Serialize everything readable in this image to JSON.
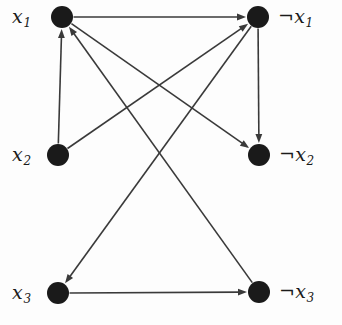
{
  "figure": {
    "kind": "implication-graph",
    "title": "",
    "background_color": "#fdfdfd",
    "node_color": "#1a1a1a",
    "edge_color": "#3a3a3a",
    "label_color": "#1a1a1a"
  },
  "nodes": [
    {
      "id": "x1",
      "label_prefix": "",
      "label_var": "x",
      "label_sub": "1",
      "label_text": "x1",
      "x": 62,
      "y": 17,
      "r": 11,
      "label_x": 12,
      "label_y": 7,
      "label_align": "left"
    },
    {
      "id": "nx1",
      "label_prefix": "¬",
      "label_var": "x",
      "label_sub": "1",
      "label_text": "¬x1",
      "x": 258,
      "y": 17,
      "r": 11,
      "label_x": 278,
      "label_y": 7,
      "label_align": "left"
    },
    {
      "id": "x2",
      "label_prefix": "",
      "label_var": "x",
      "label_sub": "2",
      "label_text": "x2",
      "x": 58,
      "y": 155,
      "r": 11,
      "label_x": 12,
      "label_y": 145,
      "label_align": "left"
    },
    {
      "id": "nx2",
      "label_prefix": "¬",
      "label_var": "x",
      "label_sub": "2",
      "label_text": "¬x2",
      "x": 259,
      "y": 155,
      "r": 11,
      "label_x": 279,
      "label_y": 145,
      "label_align": "left"
    },
    {
      "id": "x3",
      "label_prefix": "",
      "label_var": "x",
      "label_sub": "3",
      "label_text": "x3",
      "x": 58,
      "y": 293,
      "r": 11,
      "label_x": 12,
      "label_y": 283,
      "label_align": "left"
    },
    {
      "id": "nx3",
      "label_prefix": "¬",
      "label_var": "x",
      "label_sub": "3",
      "label_text": "¬x3",
      "x": 259,
      "y": 292,
      "r": 11,
      "label_x": 279,
      "label_y": 282,
      "label_align": "left"
    }
  ],
  "edges": [
    {
      "id": "e1",
      "from": "x1",
      "to": "nx1",
      "directed": true,
      "name": "edge-x1-to-nx1"
    },
    {
      "id": "e2",
      "from": "x2",
      "to": "x1",
      "directed": true,
      "name": "edge-x2-to-x1"
    },
    {
      "id": "e3",
      "from": "x2",
      "to": "nx1",
      "directed": true,
      "name": "edge-x2-to-nx1"
    },
    {
      "id": "e4",
      "from": "nx1",
      "to": "nx2",
      "directed": true,
      "name": "edge-nx1-to-nx2"
    },
    {
      "id": "e5",
      "from": "x1",
      "to": "nx2",
      "directed": true,
      "name": "edge-x1-to-nx2"
    },
    {
      "id": "e6",
      "from": "nx1",
      "to": "x3",
      "directed": true,
      "name": "edge-nx1-to-x3"
    },
    {
      "id": "e7",
      "from": "x3",
      "to": "nx3",
      "directed": true,
      "name": "edge-x3-to-nx3"
    },
    {
      "id": "e8",
      "from": "nx3",
      "to": "x1",
      "directed": true,
      "name": "edge-nx3-to-x1"
    }
  ],
  "style": {
    "edge_width": 1.6,
    "arrow_length": 9,
    "arrow_half_width": 3.4
  }
}
